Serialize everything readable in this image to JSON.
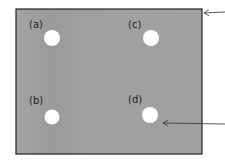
{
  "figure": {
    "plate": {
      "x": 16,
      "y": 9,
      "width": 186,
      "height": 145,
      "fill": "#9e9e9e",
      "stroke": "#222222"
    },
    "holes": [
      {
        "id": "a",
        "label": "(a)",
        "cx": 52,
        "cy": 38,
        "r": 8,
        "label_x": 29,
        "label_y": 28
      },
      {
        "id": "c",
        "label": "(c)",
        "cx": 151,
        "cy": 38,
        "r": 8,
        "label_x": 128,
        "label_y": 28
      },
      {
        "id": "b",
        "label": "(b)",
        "cx": 52,
        "cy": 117,
        "r": 7.5,
        "label_x": 29,
        "label_y": 104
      },
      {
        "id": "d",
        "label": "(d)",
        "cx": 150,
        "cy": 115,
        "r": 8,
        "label_x": 128,
        "label_y": 103
      }
    ],
    "arrows": [
      {
        "from": [
          225,
          12
        ],
        "to": [
          204,
          13
        ]
      },
      {
        "from": [
          225,
          124
        ],
        "to": [
          163,
          123
        ]
      }
    ]
  }
}
